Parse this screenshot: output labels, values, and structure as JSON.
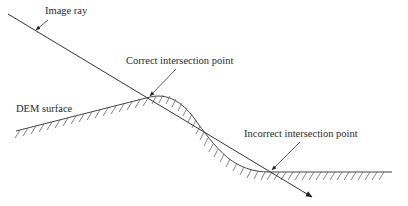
{
  "diagram": {
    "labels": {
      "image_ray": "Image ray",
      "correct_point": "Correct intersection point",
      "dem_surface": "DEM surface",
      "incorrect_point": "Incorrect intersection point"
    },
    "colors": {
      "line": "#333333",
      "hatch": "#555555",
      "text": "#2a2a2a",
      "background": "#ffffff"
    }
  }
}
